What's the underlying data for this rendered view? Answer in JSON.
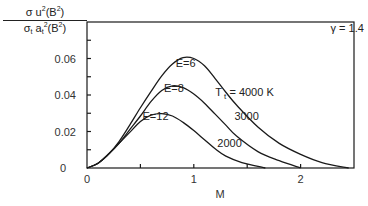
{
  "chart_data": {
    "type": "line",
    "title": "",
    "xlabel": "M",
    "ylabel": "σ u²(B²) / σ_t a_t²(B²)",
    "ylabel_parts": {
      "numerator": "σ u²(B²)",
      "denominator": "σ_t a_t²(B²)"
    },
    "xlim": [
      0,
      2.5
    ],
    "ylim": [
      0,
      0.08
    ],
    "x_ticks": [
      0,
      0.5,
      1,
      1.5,
      2,
      2.5
    ],
    "x_tick_labels": [
      "0",
      "",
      "1",
      "",
      "2",
      ""
    ],
    "y_ticks": [
      0,
      0.01,
      0.02,
      0.03,
      0.04,
      0.05,
      0.06,
      0.07
    ],
    "y_tick_labels": [
      "0",
      "",
      "0.02",
      "",
      "0.04",
      "",
      "0.06",
      ""
    ],
    "grid": false,
    "annotations": [
      {
        "text": "γ = 1.4",
        "x": 2.28,
        "y": 0.0745
      },
      {
        "text": "E=6",
        "x": 0.83,
        "y": 0.0555
      },
      {
        "text": "E=8",
        "x": 0.72,
        "y": 0.0415
      },
      {
        "text": "E=12",
        "x": 0.52,
        "y": 0.0265
      },
      {
        "text": "T_t = 4000 K",
        "x": 1.2,
        "y": 0.0395
      },
      {
        "text": "3000",
        "x": 1.38,
        "y": 0.0265
      },
      {
        "text": "2000",
        "x": 1.22,
        "y": 0.0115
      }
    ],
    "series": [
      {
        "name": "E=6, T_t = 4000 K",
        "x": [
          0,
          0.1,
          0.2,
          0.3,
          0.4,
          0.5,
          0.6,
          0.7,
          0.8,
          0.9,
          1.0,
          1.1,
          1.2,
          1.3,
          1.4,
          1.6,
          1.8,
          2.0,
          2.2,
          2.45
        ],
        "y": [
          0,
          0.0025,
          0.0075,
          0.0145,
          0.0235,
          0.033,
          0.042,
          0.0505,
          0.057,
          0.0605,
          0.06,
          0.056,
          0.049,
          0.0415,
          0.0345,
          0.0225,
          0.0135,
          0.0075,
          0.003,
          0
        ]
      },
      {
        "name": "E=8, T_t = 3000 K",
        "x": [
          0,
          0.1,
          0.2,
          0.3,
          0.4,
          0.5,
          0.6,
          0.7,
          0.8,
          0.9,
          1.0,
          1.1,
          1.2,
          1.3,
          1.4,
          1.6,
          1.8,
          2.0
        ],
        "y": [
          0,
          0.0025,
          0.0075,
          0.0135,
          0.021,
          0.0285,
          0.0365,
          0.0425,
          0.045,
          0.044,
          0.0405,
          0.0355,
          0.0295,
          0.0235,
          0.0175,
          0.009,
          0.004,
          0
        ]
      },
      {
        "name": "E=12, T_t = 2000 K",
        "x": [
          0,
          0.1,
          0.2,
          0.3,
          0.4,
          0.5,
          0.6,
          0.7,
          0.8,
          0.9,
          1.0,
          1.1,
          1.2,
          1.3,
          1.45,
          1.67
        ],
        "y": [
          0,
          0.0025,
          0.0075,
          0.0135,
          0.0195,
          0.0255,
          0.029,
          0.0298,
          0.0285,
          0.025,
          0.0205,
          0.0155,
          0.0105,
          0.0065,
          0.003,
          0
        ]
      }
    ]
  }
}
